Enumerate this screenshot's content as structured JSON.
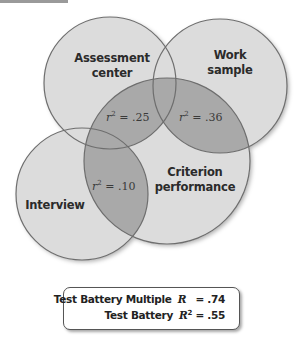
{
  "diagram": {
    "type": "venn",
    "colors": {
      "circle_fill": "#dcdcdc",
      "overlap_fill": "#a9a9a9",
      "stroke": "#6e6e6e"
    },
    "circles": [
      {
        "id": "assessment",
        "label_line1": "Assessment",
        "label_line2": "center"
      },
      {
        "id": "work",
        "label_line1": "Work",
        "label_line2": "sample"
      },
      {
        "id": "interview",
        "label_line1": "Interview"
      },
      {
        "id": "criterion",
        "label_line1": "Criterion",
        "label_line2": "performance"
      }
    ],
    "overlaps": [
      {
        "between": "Assessment center & Criterion performance",
        "symbol": "r",
        "power": "2",
        "value": "= .25"
      },
      {
        "between": "Work sample & Criterion performance",
        "symbol": "r",
        "power": "2",
        "value": "= .36"
      },
      {
        "between": "Interview & Criterion performance",
        "symbol": "r",
        "power": "2",
        "value": "= .10"
      }
    ]
  },
  "summary": {
    "row1": {
      "label": "Test Battery Multiple",
      "symbol": "R",
      "power": "",
      "value": "= .74"
    },
    "row2": {
      "label": "Test Battery",
      "symbol": "R",
      "power": "2",
      "value": "= .55"
    }
  }
}
